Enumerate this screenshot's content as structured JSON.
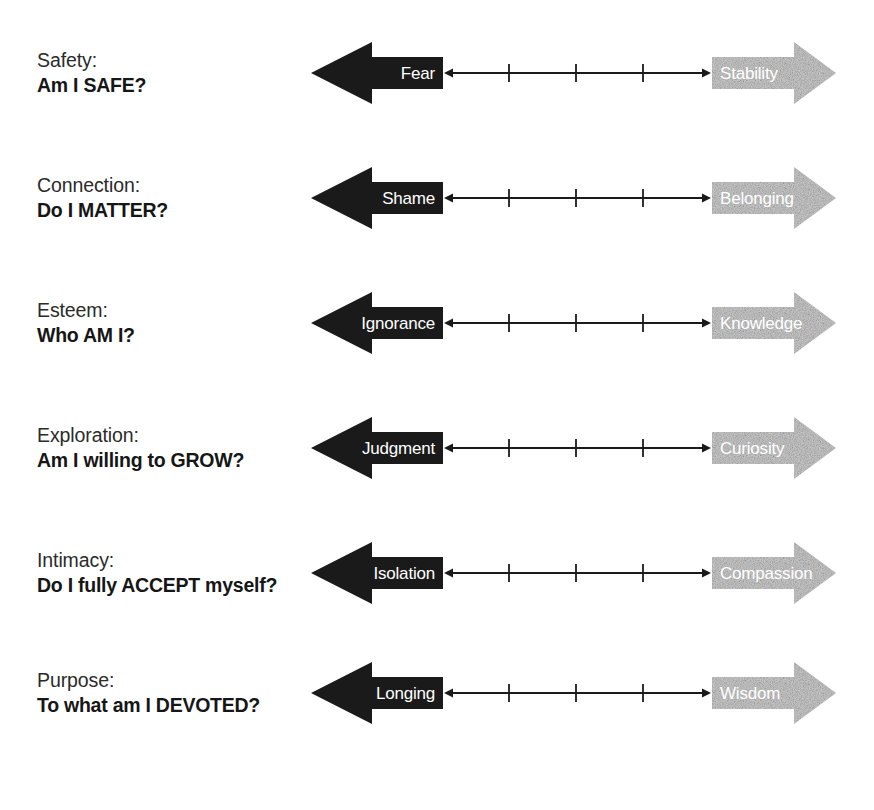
{
  "diagram": {
    "colors": {
      "negative_arrow": "#1a1a1a",
      "positive_arrow": "#cfcfcf",
      "arrow_label_text": "#ffffff",
      "need_text": "#2b2b2b",
      "question_text": "#161616",
      "connector_line": "#1a1a1a",
      "background": "#ffffff"
    },
    "connector": {
      "tick_count": 3,
      "double_headed": true
    },
    "rows": [
      {
        "need": "Safety:",
        "question": "Am I SAFE?",
        "negative": "Fear",
        "positive": "Stability"
      },
      {
        "need": "Connection:",
        "question": "Do I MATTER?",
        "negative": "Shame",
        "positive": "Belonging"
      },
      {
        "need": "Esteem:",
        "question": "Who AM I?",
        "negative": "Ignorance",
        "positive": "Knowledge"
      },
      {
        "need": "Exploration:",
        "question": "Am I willing to GROW?",
        "negative": "Judgment",
        "positive": "Curiosity"
      },
      {
        "need": "Intimacy:",
        "question": "Do I fully ACCEPT myself?",
        "negative": "Isolation",
        "positive": "Compassion"
      },
      {
        "need": "Purpose:",
        "question": "To what am I DEVOTED?",
        "negative": "Longing",
        "positive": "Wisdom"
      }
    ]
  }
}
